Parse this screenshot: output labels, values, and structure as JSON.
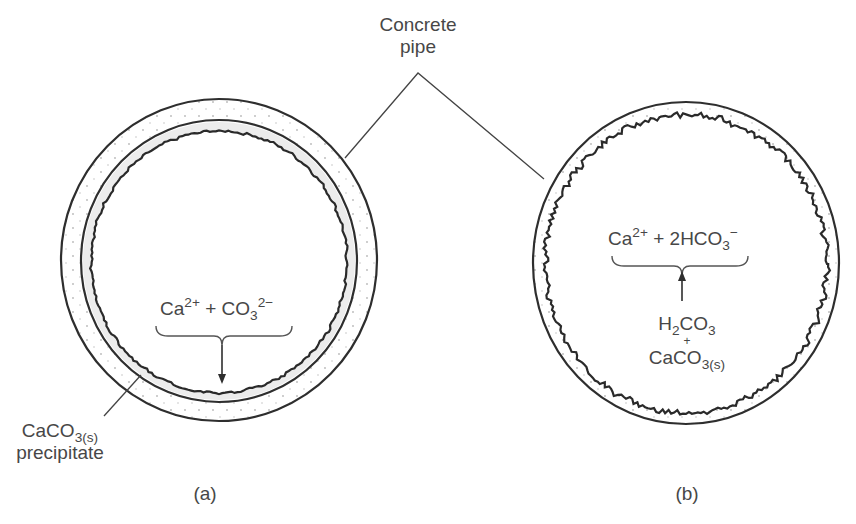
{
  "title_label": {
    "line1": "Concrete",
    "line2": "pipe"
  },
  "panel_a": {
    "caption": "(a)",
    "reaction": {
      "ion1": "Ca",
      "ion1_charge": "2+",
      "plus": "+",
      "ion2": "CO",
      "ion2_sub": "3",
      "ion2_charge": "2−"
    },
    "precipitate_label": {
      "formula": "CaCO",
      "formula_sub": "3(s)",
      "word": "precipitate"
    },
    "arrow_direction": "down"
  },
  "panel_b": {
    "caption": "(b)",
    "products": {
      "ion1": "Ca",
      "ion1_charge": "2+",
      "plus": "+",
      "ion2": "2HCO",
      "ion2_sub": "3",
      "ion2_charge": "−"
    },
    "reactants": {
      "r1_a": "H",
      "r1_sub": "2",
      "r1_b": "CO",
      "r1_sub2": "3",
      "plus": "+",
      "r2": "CaCO",
      "r2_sub": "3(s)"
    },
    "arrow_direction": "up"
  },
  "colors": {
    "line": "#2e2e2e",
    "text": "#474747",
    "dots": "#b5b5b5"
  }
}
